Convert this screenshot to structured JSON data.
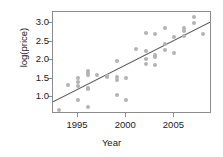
{
  "chart_data": {
    "type": "scatter",
    "title": "",
    "xlabel": "Year",
    "ylabel": "log(price)",
    "xlim": [
      1992.4,
      2008.9
    ],
    "ylim": [
      0.55,
      3.3
    ],
    "xticks": [
      1995,
      2000,
      2005
    ],
    "xtick_labels": [
      "1995",
      "2000",
      "2005"
    ],
    "yticks": [
      1.0,
      1.5,
      2.0,
      2.5,
      3.0
    ],
    "ytick_labels": [
      "1.0",
      "1.5",
      "2.0",
      "2.5",
      "3.0"
    ],
    "grid": false,
    "legend": null,
    "point_color": "#b3b3b3",
    "line_color": "#595959",
    "frame_color": "#8c8c8c",
    "points": [
      [
        1993.0,
        0.66
      ],
      [
        1994.0,
        1.33
      ],
      [
        1995.0,
        1.52
      ],
      [
        1995.0,
        1.42
      ],
      [
        1995.0,
        1.3
      ],
      [
        1995.0,
        0.93
      ],
      [
        1996.0,
        1.72
      ],
      [
        1996.0,
        1.66
      ],
      [
        1996.0,
        1.6
      ],
      [
        1996.0,
        1.26
      ],
      [
        1996.0,
        1.23
      ],
      [
        1996.0,
        0.75
      ],
      [
        1997.0,
        1.6
      ],
      [
        1998.0,
        1.58
      ],
      [
        1998.0,
        1.54
      ],
      [
        1999.0,
        1.99
      ],
      [
        1999.0,
        1.55
      ],
      [
        1999.0,
        1.47
      ],
      [
        1999.0,
        1.05
      ],
      [
        2000.0,
        1.51
      ],
      [
        2000.0,
        0.92
      ],
      [
        2001.0,
        2.3
      ],
      [
        2002.0,
        2.74
      ],
      [
        2002.0,
        2.25
      ],
      [
        2002.0,
        2.02
      ],
      [
        2002.0,
        1.9
      ],
      [
        2003.0,
        2.71
      ],
      [
        2003.0,
        2.15
      ],
      [
        2003.0,
        2.08
      ],
      [
        2003.0,
        1.88
      ],
      [
        2004.0,
        2.88
      ],
      [
        2004.0,
        2.43
      ],
      [
        2004.0,
        2.28
      ],
      [
        2005.0,
        2.63
      ],
      [
        2005.0,
        2.2
      ],
      [
        2006.0,
        2.86
      ],
      [
        2006.0,
        2.8
      ],
      [
        2006.0,
        2.66
      ],
      [
        2007.0,
        3.16
      ],
      [
        2007.0,
        3.0
      ],
      [
        2008.0,
        2.7
      ]
    ],
    "fit_line": {
      "x": [
        1992.4,
        2008.9
      ],
      "y": [
        0.83,
        3.02
      ]
    }
  }
}
